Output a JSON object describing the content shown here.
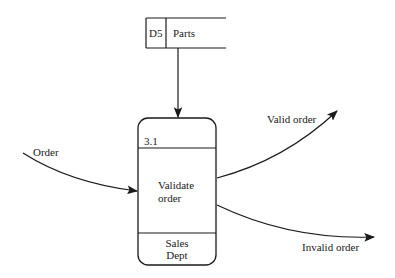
{
  "diagram": {
    "type": "data-flow-diagram",
    "data_store": {
      "id": "D5",
      "name": "Parts"
    },
    "process": {
      "id": "3.1",
      "name_line1": "Validate",
      "name_line2": "order",
      "location_line1": "Sales",
      "location_line2": "Dept"
    },
    "flows": {
      "input": "Order",
      "output_valid": "Valid order",
      "output_invalid": "Invalid order"
    },
    "colors": {
      "stroke": "#1a1a1a",
      "background": "#ffffff"
    }
  }
}
